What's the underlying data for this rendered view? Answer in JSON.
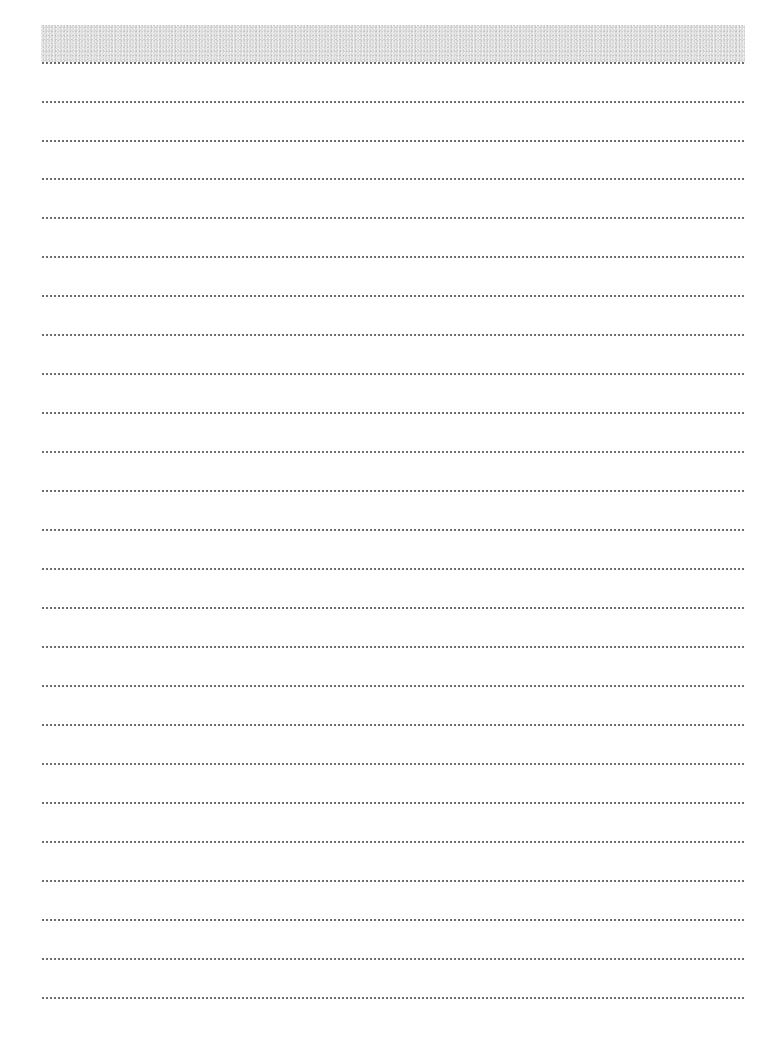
{
  "page": {
    "type": "lined-notepaper",
    "background_color": "#ffffff",
    "header_band": {
      "color": "#dcdcdc",
      "top": 25,
      "height": 37,
      "left": 41,
      "width": 704
    },
    "rules": {
      "style": "dotted",
      "color": "#6e6e6e",
      "left": 41,
      "width": 704,
      "count": 25,
      "positions": [
        62,
        101,
        140,
        178,
        217,
        256,
        295,
        334,
        373,
        412,
        451,
        490,
        529,
        568,
        607,
        646,
        685,
        724,
        763,
        802,
        841,
        880,
        919,
        958,
        997
      ]
    }
  }
}
